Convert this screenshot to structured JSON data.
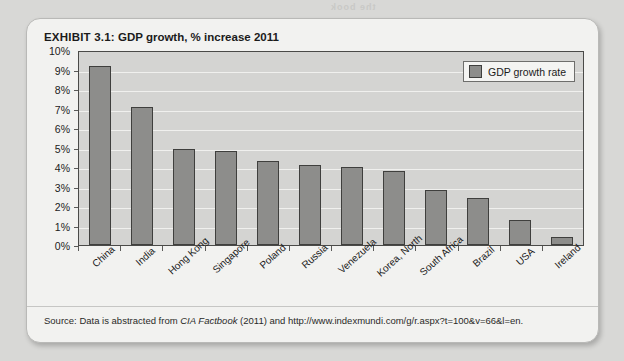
{
  "page": {
    "bleed_text_1": "the book",
    "bleed_text_2": "1.5 International",
    "bleed_text_3": "WHERE ARE TOMORROW'S CUSTOMERS COMING"
  },
  "exhibit": {
    "label": "EXHIBIT 3.1:",
    "title": "GDP growth, % increase 2011",
    "source_prefix": "Source: Data is abstracted from ",
    "source_italic": "CIA Factbook",
    "source_suffix": " (2011) and http://www.indexmundi.com/g/r.aspx?t=100&v=66&l=en."
  },
  "chart_data": {
    "type": "bar",
    "title": "GDP growth, % increase 2011",
    "xlabel": "",
    "ylabel": "",
    "ylim": [
      0,
      10
    ],
    "ytick_labels": [
      "10%",
      "9%",
      "8%",
      "7%",
      "6%",
      "5%",
      "4%",
      "3%",
      "2%",
      "1%",
      "0%"
    ],
    "ytick_values": [
      10,
      9,
      8,
      7,
      6,
      5,
      4,
      3,
      2,
      1,
      0
    ],
    "grid": true,
    "legend_position": "top-right",
    "legend": [
      "GDP growth rate"
    ],
    "series_name": "GDP growth rate",
    "bar_color": "#8d8d8b",
    "bar_border_color": "#3f3f3d",
    "plot_background": "#d4d4d2",
    "categories": [
      "China",
      "India",
      "Hong Kong",
      "Singapore",
      "Poland",
      "Russia",
      "Venezuela",
      "Korea, North",
      "South Africa",
      "Brazil",
      "USA",
      "Ireland"
    ],
    "values": [
      9.2,
      7.1,
      4.9,
      4.8,
      4.3,
      4.1,
      4.0,
      3.8,
      2.8,
      2.4,
      1.3,
      0.4
    ]
  }
}
